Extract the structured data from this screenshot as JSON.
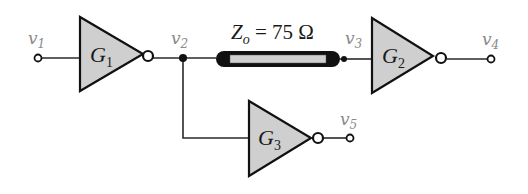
{
  "diagram": {
    "type": "logic-circuit",
    "colors": {
      "gate_fill": "#cfcfcf",
      "line": "#111111",
      "label_gray": "#8a8a8a",
      "tline_inner": "#d0d0d0"
    },
    "transmission_line": {
      "label_main": "Z",
      "label_sub": "o",
      "label_rest": " = 75 Ω"
    },
    "nodes": [
      {
        "id": "v1",
        "main": "v",
        "sub": "1"
      },
      {
        "id": "v2",
        "main": "v",
        "sub": "2"
      },
      {
        "id": "v3",
        "main": "v",
        "sub": "3"
      },
      {
        "id": "v4",
        "main": "v",
        "sub": "4"
      },
      {
        "id": "v5",
        "main": "v",
        "sub": "5"
      }
    ],
    "gates": [
      {
        "id": "G1",
        "main": "G",
        "sub": "1",
        "type": "inverter"
      },
      {
        "id": "G2",
        "main": "G",
        "sub": "2",
        "type": "inverter"
      },
      {
        "id": "G3",
        "main": "G",
        "sub": "3",
        "type": "inverter"
      }
    ]
  }
}
